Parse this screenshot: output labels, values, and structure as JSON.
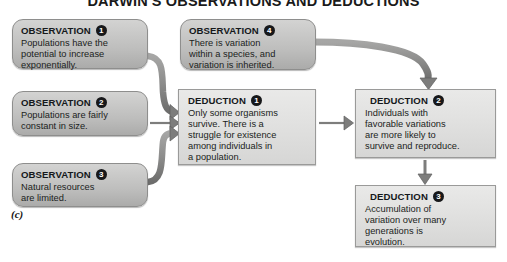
{
  "figure": {
    "title": "DARWIN'S OBSERVATIONS AND DEDUCTIONS",
    "caption": "(c)",
    "label_word_observation": "OBSERVATION",
    "label_word_deduction": "DEDUCTION"
  },
  "colors": {
    "observation_box_fill": "#c9c9c8",
    "observation_box_border": "#8e8e8d",
    "deduction_box_fill": "#e2e2e1",
    "deduction_box_border": "#9a9a99",
    "arrow_fill": "#8a8a89",
    "arrow_stroke": "#5f5f5e",
    "badge_fill": "#17181a",
    "badge_text": "#ffffff",
    "text": "#1b1e21",
    "page_background": "#ffffff"
  },
  "observations": [
    {
      "number": "1",
      "label": "OBSERVATION",
      "text": "Populations have the\npotential to increase\nexponentially."
    },
    {
      "number": "2",
      "label": "OBSERVATION",
      "text": "Populations are fairly\nconstant in size."
    },
    {
      "number": "3",
      "label": "OBSERVATION",
      "text": "Natural resources\nare limited."
    },
    {
      "number": "4",
      "label": "OBSERVATION",
      "text": "There is variation\nwithin a species, and\nvariation is inherited."
    }
  ],
  "deductions": [
    {
      "number": "1",
      "label": "DEDUCTION",
      "text": "Only some organisms\nsurvive. There is a\nstruggle for existence\namong individuals in\na population."
    },
    {
      "number": "2",
      "label": "DEDUCTION",
      "text": "Individuals with\nfavorable variations\nare more likely to\nsurvive and reproduce."
    },
    {
      "number": "3",
      "label": "DEDUCTION",
      "text": "Accumulation of\nvariation over many\ngenerations is\nevolution."
    }
  ],
  "connections": [
    {
      "from": "observation-1",
      "to": "deduction-1",
      "style": "curved-arrow"
    },
    {
      "from": "observation-2",
      "to": "deduction-1",
      "style": "straight-arrow"
    },
    {
      "from": "observation-3",
      "to": "deduction-1",
      "style": "curved-arrow"
    },
    {
      "from": "observation-4",
      "to": "deduction-2",
      "style": "curved-arrow"
    },
    {
      "from": "deduction-1",
      "to": "deduction-2",
      "style": "straight-arrow"
    },
    {
      "from": "deduction-2",
      "to": "deduction-3",
      "style": "straight-arrow-down"
    }
  ]
}
